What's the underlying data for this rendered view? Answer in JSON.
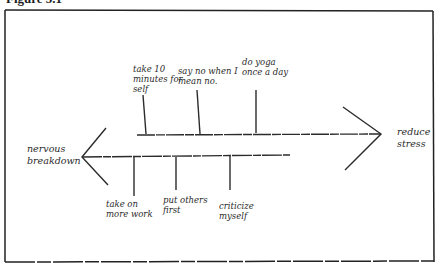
{
  "figure": {
    "title": "Figure 5.1",
    "frame_color": "#222222",
    "line_color": "#2b2b2b"
  },
  "diagram": {
    "type": "force-field / fishbone",
    "left_outcome": "nervous\nbreakdown",
    "right_outcome": "reduce\nstress",
    "upper_branches": [
      {
        "label": "take 10\nminutes for\nself"
      },
      {
        "label": "say no when I\nmean no."
      },
      {
        "label": "do yoga\nonce a day"
      }
    ],
    "lower_branches": [
      {
        "label": "take on\nmore work"
      },
      {
        "label": "put others\nfirst"
      },
      {
        "label": "criticize\nmyself"
      }
    ]
  }
}
